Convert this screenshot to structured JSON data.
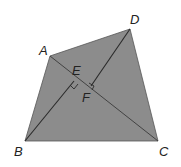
{
  "diagram": {
    "fill_color": "#8c8c8c",
    "line_color": "#2a2a2a",
    "vertices": {
      "A": {
        "label": "A",
        "x": 50,
        "y": 56
      },
      "B": {
        "label": "B",
        "x": 25,
        "y": 141
      },
      "C": {
        "label": "C",
        "x": 158,
        "y": 141
      },
      "D": {
        "label": "D",
        "x": 130,
        "y": 29
      }
    },
    "points": {
      "E": {
        "label": "E",
        "x": 74,
        "y": 81
      },
      "F": {
        "label": "F",
        "x": 91,
        "y": 86
      }
    },
    "segments": [
      "AB",
      "BC",
      "CD",
      "DA",
      "AC",
      "BE",
      "DF"
    ],
    "right_angles": [
      "E",
      "F"
    ]
  }
}
